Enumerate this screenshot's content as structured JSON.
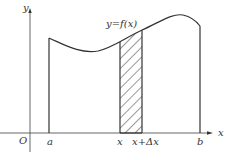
{
  "diagram": {
    "labels": {
      "y_axis": "y",
      "x_axis": "x",
      "origin": "O",
      "a": "a",
      "b": "b",
      "x": "x",
      "x_plus_dx": "x+Δx",
      "curve": "y=f(x)"
    },
    "colors": {
      "stroke": "#333333",
      "background": "#ffffff"
    },
    "shapes": {
      "curve": "y = f(x) from a to b",
      "strip": "hatched rectangle from x to x+Δx"
    }
  }
}
